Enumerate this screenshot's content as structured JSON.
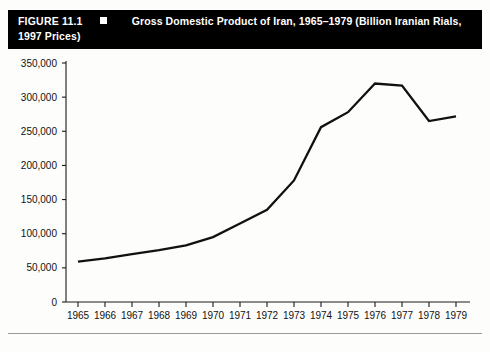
{
  "figure": {
    "number_label": "FIGURE 11.1",
    "bullet": "square-bullet",
    "title_line1": "Gross Domestic Product of Iran, 1965–1979 (Billion Iranian Rials,",
    "title_line2": "1997 Prices)"
  },
  "chart_data": {
    "type": "line",
    "title": "Gross Domestic Product of Iran, 1965–1979 (Billion Iranian Rials, 1997 Prices)",
    "xlabel": "",
    "ylabel": "",
    "categories": [
      "1965",
      "1966",
      "1967",
      "1968",
      "1969",
      "1970",
      "1971",
      "1972",
      "1973",
      "1974",
      "1975",
      "1976",
      "1977",
      "1978",
      "1979"
    ],
    "values": [
      59000,
      64000,
      70000,
      76000,
      83000,
      95000,
      115000,
      135000,
      178000,
      256000,
      278000,
      320000,
      317000,
      265000,
      272000
    ],
    "ylim": [
      0,
      350000
    ],
    "yticks": [
      0,
      50000,
      100000,
      150000,
      200000,
      250000,
      300000,
      350000
    ],
    "ytick_labels": [
      "0",
      "50,000",
      "100,000",
      "150,000",
      "200,000",
      "250,000",
      "300,000",
      "350,000"
    ],
    "xtick_labels": [
      "1965",
      "1966",
      "1967",
      "1968",
      "1969",
      "1970",
      "1971",
      "1972",
      "1973",
      "1974",
      "1975",
      "1976",
      "1977",
      "1978",
      "1979"
    ],
    "grid": false,
    "legend": null,
    "series_color": "#111111"
  }
}
